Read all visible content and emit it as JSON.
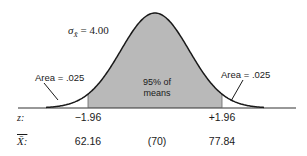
{
  "chart_data": {
    "type": "area",
    "title": "",
    "distribution": "normal (sampling distribution of the mean)",
    "mean": 70,
    "standard_error": 4.0,
    "sigma_label": "σX̄ = 4.00",
    "sigma_value": "4.00",
    "shaded_region": {
      "z_low": -1.96,
      "z_high": 1.96,
      "x_low": 62.16,
      "x_high": 77.84,
      "label_line1": "95% of",
      "label_line2": "means"
    },
    "tails": [
      {
        "side": "left",
        "label": "Area = .025",
        "area": 0.025
      },
      {
        "side": "right",
        "label": "Area = .025",
        "area": 0.025
      }
    ],
    "axes": {
      "z_row_label": "z:",
      "z_ticks": [
        "−1.96",
        "+1.96"
      ],
      "xbar_row_label": "X̄:",
      "xbar_ticks": [
        "62.16",
        "(70)",
        "77.84"
      ]
    },
    "colors": {
      "shade": "#b9b9b9",
      "curve": "#1a1a1a",
      "axis": "#333333",
      "background": "#ffffff"
    }
  },
  "labels": {
    "sigma_symbol": "σ",
    "sigma_sub": "X̄",
    "sigma_eq": " = 4.00",
    "left_area": "Area = .025",
    "right_area": "Area = .025",
    "center_line1": "95% of",
    "center_line2": "means",
    "z_label": "z:",
    "z_low": "−1.96",
    "z_high": "+1.96",
    "xbar_label": "X̄:",
    "xbar_low": "62.16",
    "xbar_mean": "(70)",
    "xbar_high": "77.84"
  }
}
